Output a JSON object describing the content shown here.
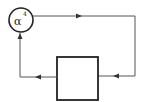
{
  "diagram": {
    "title": "",
    "nodes": [
      {
        "id": "gain",
        "shape": "circle",
        "label_base": "α",
        "label_exp": "4"
      },
      {
        "id": "block",
        "shape": "rectangle",
        "label": ""
      }
    ],
    "edges": [
      {
        "from": "gain",
        "to": "block",
        "route": "top-right-loop"
      },
      {
        "from": "block",
        "to": "gain",
        "route": "bottom-left-loop"
      }
    ],
    "colors": {
      "stroke": "#222222",
      "line": "#555555",
      "background": "#ffffff"
    }
  }
}
